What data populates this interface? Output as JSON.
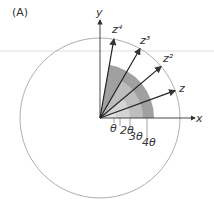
{
  "figure": {
    "panel_label": "(A)",
    "axes": {
      "x_label": "x",
      "y_label": "y"
    },
    "vectors": [
      {
        "label": "z",
        "power": 1,
        "angle_deg": 20
      },
      {
        "label": "z²",
        "power": 2,
        "angle_deg": 40
      },
      {
        "label": "z³",
        "power": 3,
        "angle_deg": 60
      },
      {
        "label": "z⁴",
        "power": 4,
        "angle_deg": 80
      }
    ],
    "angle_labels": [
      "θ",
      "2θ",
      "3θ",
      "4θ"
    ],
    "colors": {
      "line": "#333333",
      "circle": "#888888",
      "shade_dark": "#9a9a9a",
      "shade_mid": "#b8b8b8",
      "shade_light": "#d2d2d2",
      "shade_lightest": "#e4e4e4"
    }
  }
}
